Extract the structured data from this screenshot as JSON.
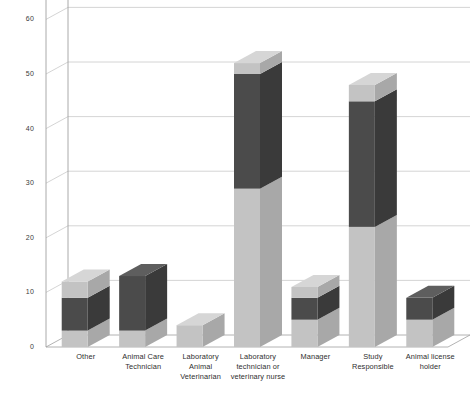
{
  "chart_data": {
    "type": "bar",
    "subtype": "stacked-column-3d",
    "title": "",
    "xlabel": "",
    "ylabel": "",
    "ylim": [
      0,
      60
    ],
    "yticks": [
      0,
      10,
      20,
      30,
      40,
      50,
      60
    ],
    "ytick_labels": [
      "0",
      "10",
      "20",
      "30",
      "40",
      "50",
      "60"
    ],
    "grid": true,
    "grid_axis": "y",
    "legend": "none",
    "categories": [
      "Other",
      "Animal Care Technician",
      "Laboratory Animal Veterinarian",
      "Laboratory technician or veterinary nurse",
      "Manager",
      "Study Responsible",
      "Animal license holder"
    ],
    "category_lines": [
      [
        "Other"
      ],
      [
        "Animal Care",
        "Technician"
      ],
      [
        "Laboratory",
        "Animal",
        "Veterinarian"
      ],
      [
        "Laboratory",
        "technician or",
        "veterinary nurse"
      ],
      [
        "Manager"
      ],
      [
        "Study",
        "Responsible"
      ],
      [
        "Animal license",
        "holder"
      ]
    ],
    "series": [
      {
        "name": "series-1",
        "color": "#c3c3c3",
        "values": [
          3,
          3,
          4,
          29,
          5,
          22,
          5
        ]
      },
      {
        "name": "series-2",
        "color": "#4b4b4b",
        "values": [
          6,
          10,
          0,
          21,
          4,
          23,
          4
        ]
      },
      {
        "name": "series-3",
        "color": "#c3c3c3",
        "values": [
          3,
          0,
          0,
          2,
          2,
          3,
          0
        ]
      }
    ],
    "totals": [
      12,
      13,
      4,
      52,
      11,
      48,
      9
    ],
    "colors": {
      "light_segment": "#c3c3c3",
      "light_segment_side": "#a8a8a8",
      "light_segment_top": "#d6d6d6",
      "dark_segment": "#4b4b4b",
      "dark_segment_side": "#3a3a3a",
      "dark_segment_top": "#5e5e5e",
      "gridline": "#c9c9c9",
      "axis": "#a0a0a0",
      "background": "#ffffff",
      "text": "#2e2e2e"
    }
  }
}
